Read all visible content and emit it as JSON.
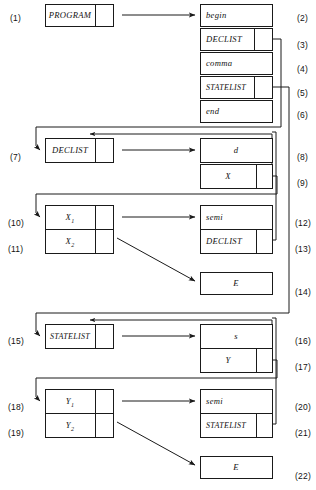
{
  "diagram": {
    "type": "record-linked-structure",
    "line_color": "#1a1a1a",
    "background": "#ffffff",
    "left_labels": [
      {
        "id": "1",
        "text": "(1)",
        "x": 10,
        "y": 13
      },
      {
        "id": "7",
        "text": "(7)",
        "x": 10,
        "y": 152
      },
      {
        "id": "10",
        "text": "(10)",
        "x": 8,
        "y": 218
      },
      {
        "id": "11",
        "text": "(11)",
        "x": 8,
        "y": 244
      },
      {
        "id": "15",
        "text": "(15)",
        "x": 8,
        "y": 336
      },
      {
        "id": "18",
        "text": "(18)",
        "x": 8,
        "y": 402
      },
      {
        "id": "19",
        "text": "(19)",
        "x": 8,
        "y": 428
      }
    ],
    "right_labels": [
      {
        "id": "2",
        "text": "(2)",
        "x": 297,
        "y": 13
      },
      {
        "id": "3",
        "text": "(3)",
        "x": 297,
        "y": 40
      },
      {
        "id": "4",
        "text": "(4)",
        "x": 297,
        "y": 64
      },
      {
        "id": "5",
        "text": "(5)",
        "x": 297,
        "y": 88
      },
      {
        "id": "6",
        "text": "(6)",
        "x": 297,
        "y": 110
      },
      {
        "id": "8",
        "text": "(8)",
        "x": 297,
        "y": 152
      },
      {
        "id": "9",
        "text": "(9)",
        "x": 297,
        "y": 178
      },
      {
        "id": "12",
        "text": "(12)",
        "x": 295,
        "y": 218
      },
      {
        "id": "13",
        "text": "(13)",
        "x": 295,
        "y": 244
      },
      {
        "id": "14",
        "text": "(14)",
        "x": 295,
        "y": 287
      },
      {
        "id": "16",
        "text": "(16)",
        "x": 295,
        "y": 336
      },
      {
        "id": "17",
        "text": "(17)",
        "x": 295,
        "y": 362
      },
      {
        "id": "20",
        "text": "(20)",
        "x": 295,
        "y": 402
      },
      {
        "id": "21",
        "text": "(21)",
        "x": 295,
        "y": 428
      },
      {
        "id": "22",
        "text": "(22)",
        "x": 295,
        "y": 471
      }
    ],
    "nodes": [
      {
        "key": "program",
        "label": "PROGRAM",
        "x": 45,
        "y": 4,
        "w": 68,
        "h": 22,
        "ptr": true,
        "ptr_w": 18
      },
      {
        "key": "begin",
        "label": "begin",
        "x": 200,
        "y": 4,
        "w": 72,
        "h": 22,
        "ptr": false,
        "align": "left"
      },
      {
        "key": "declist3",
        "label": "DECLIST",
        "x": 200,
        "y": 28,
        "w": 72,
        "h": 22,
        "ptr": true,
        "ptr_w": 18,
        "align": "left"
      },
      {
        "key": "comma",
        "label": "comma",
        "x": 200,
        "y": 52,
        "w": 72,
        "h": 22,
        "ptr": false,
        "align": "left"
      },
      {
        "key": "statelist5",
        "label": "STATELIST",
        "x": 200,
        "y": 76,
        "w": 72,
        "h": 22,
        "ptr": true,
        "ptr_w": 18,
        "align": "left"
      },
      {
        "key": "end",
        "label": "end",
        "x": 200,
        "y": 100,
        "w": 72,
        "h": 22,
        "ptr": false,
        "align": "left"
      },
      {
        "key": "declist7",
        "label": "DECLIST",
        "x": 45,
        "y": 138,
        "w": 68,
        "h": 24,
        "ptr": true,
        "ptr_w": 18
      },
      {
        "key": "d8",
        "label": "d",
        "x": 200,
        "y": 138,
        "w": 72,
        "h": 24,
        "ptr": false
      },
      {
        "key": "x9",
        "label": "X",
        "x": 200,
        "y": 164,
        "w": 72,
        "h": 24,
        "ptr": true,
        "ptr_w": 16
      },
      {
        "key": "x1",
        "label": "X",
        "sub": "1",
        "x": 45,
        "y": 205,
        "w": 68,
        "h": 24,
        "ptr": true,
        "ptr_w": 18
      },
      {
        "key": "x2",
        "label": "X",
        "sub": "2",
        "x": 45,
        "y": 229,
        "w": 68,
        "h": 24,
        "ptr": true,
        "ptr_w": 18
      },
      {
        "key": "semi12",
        "label": "semi",
        "x": 200,
        "y": 205,
        "w": 72,
        "h": 24,
        "ptr": false,
        "align": "left"
      },
      {
        "key": "declist13",
        "label": "DECLIST",
        "x": 200,
        "y": 229,
        "w": 72,
        "h": 24,
        "ptr": true,
        "ptr_w": 16,
        "align": "left"
      },
      {
        "key": "e14",
        "label": "E",
        "x": 200,
        "y": 272,
        "w": 72,
        "h": 22,
        "ptr": false
      },
      {
        "key": "statelist15",
        "label": "STATELIST",
        "x": 45,
        "y": 324,
        "w": 68,
        "h": 24,
        "ptr": true,
        "ptr_w": 18
      },
      {
        "key": "s16",
        "label": "s",
        "x": 200,
        "y": 324,
        "w": 72,
        "h": 24,
        "ptr": false
      },
      {
        "key": "y17",
        "label": "Y",
        "x": 200,
        "y": 348,
        "w": 72,
        "h": 24,
        "ptr": true,
        "ptr_w": 16
      },
      {
        "key": "y1",
        "label": "Y",
        "sub": "1",
        "x": 45,
        "y": 389,
        "w": 68,
        "h": 24,
        "ptr": true,
        "ptr_w": 18
      },
      {
        "key": "y2",
        "label": "Y",
        "sub": "2",
        "x": 45,
        "y": 413,
        "w": 68,
        "h": 24,
        "ptr": true,
        "ptr_w": 18
      },
      {
        "key": "semi20",
        "label": "semi",
        "x": 200,
        "y": 389,
        "w": 72,
        "h": 24,
        "ptr": false,
        "align": "left"
      },
      {
        "key": "statelist21",
        "label": "STATELIST",
        "x": 200,
        "y": 413,
        "w": 72,
        "h": 24,
        "ptr": true,
        "ptr_w": 16,
        "align": "left"
      },
      {
        "key": "e22",
        "label": "E",
        "x": 200,
        "y": 456,
        "w": 72,
        "h": 22,
        "ptr": false
      }
    ],
    "edges": [
      {
        "from": "program",
        "to": "begin",
        "d": "M 122 15 L 195 15",
        "arrow": "end"
      },
      {
        "from": "declist3",
        "to": "declist7",
        "d": "M 272 39 L 281 39 L 281 127 L 36 127 L 36 146 L 40 150",
        "arrow": "end"
      },
      {
        "from": "statelist5",
        "to": "statelist15",
        "d": "M 272 87 L 289 87 L 289 313 L 36 313 L 36 332 L 40 336",
        "arrow": "end"
      },
      {
        "from": "declist7",
        "to": "d8",
        "d": "M 122 150 L 195 150",
        "arrow": "end"
      },
      {
        "from": "x9",
        "to": "x1",
        "d": "M 272 176 L 277 176 L 277 194 L 36 194 L 36 213 L 40 217",
        "arrow": "end"
      },
      {
        "from": "x9-loop",
        "to": "declist7-top",
        "d": "M 268 176 L 268 186 L 272 186 L 272 134 L 90 134",
        "arrow": "end-sm"
      },
      {
        "from": "x1",
        "to": "semi12",
        "d": "M 122 217 L 195 217",
        "arrow": "end"
      },
      {
        "from": "declist13",
        "to": "declist7b",
        "d": "M 272 240 L 276 240 L 276 132 L 272 132",
        "arrow": "none"
      },
      {
        "from": "x2",
        "to": "e14",
        "d": "M 117 238 L 195 281",
        "arrow": "end"
      },
      {
        "from": "y17",
        "to": "y1",
        "d": "M 272 360 L 277 360 L 277 378 L 36 378 L 36 397 L 40 401",
        "arrow": "end"
      },
      {
        "from": "y17-loop",
        "to": "statelist15-top",
        "d": "M 268 360 L 268 370 L 272 370 L 272 320 L 90 320",
        "arrow": "end-sm"
      },
      {
        "from": "statelist15",
        "to": "s16",
        "d": "M 122 336 L 195 336",
        "arrow": "end"
      },
      {
        "from": "y1",
        "to": "semi20",
        "d": "M 122 401 L 195 401",
        "arrow": "end"
      },
      {
        "from": "statelist21",
        "to": "statelist15b",
        "d": "M 272 424 L 276 424 L 276 318 L 272 318",
        "arrow": "none"
      },
      {
        "from": "y2",
        "to": "e22",
        "d": "M 117 422 L 195 465",
        "arrow": "end"
      }
    ]
  }
}
